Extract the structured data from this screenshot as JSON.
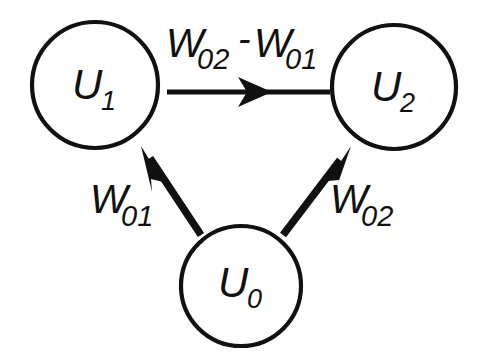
{
  "diagram": {
    "background_color": "#ffffff",
    "stroke_color": "#111111",
    "nodes": [
      {
        "id": "u1",
        "base": "U",
        "subscript": "1",
        "label": "U1",
        "cx": 95,
        "cy": 85,
        "r": 63
      },
      {
        "id": "u2",
        "base": "U",
        "subscript": "2",
        "label": "U2",
        "cx": 394,
        "cy": 87,
        "r": 62
      },
      {
        "id": "u0",
        "base": "U",
        "subscript": "0",
        "label": "U0",
        "cx": 241,
        "cy": 286,
        "r": 60
      }
    ],
    "edges": [
      {
        "id": "u1-to-u2",
        "from": "u1",
        "to": "u2",
        "label_base_1": "W",
        "label_sub_1": "02",
        "label_operator": "-",
        "label_base_2": "W",
        "label_sub_2": "01",
        "label_text": "W02 - W01"
      },
      {
        "id": "u0-to-u1",
        "from": "u0",
        "to": "u1",
        "label_base": "W",
        "label_sub": "01",
        "label_text": "W01"
      },
      {
        "id": "u0-to-u2",
        "from": "u0",
        "to": "u2",
        "label_base": "W",
        "label_sub": "02",
        "label_text": "W02"
      }
    ]
  }
}
